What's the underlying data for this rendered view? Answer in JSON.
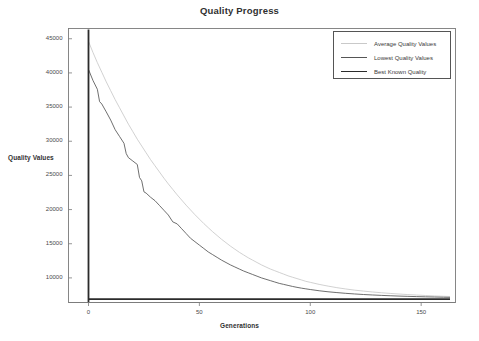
{
  "chart_data": {
    "type": "line",
    "title": "Quality Progress",
    "xlabel": "Generations",
    "ylabel": "Quality Values",
    "grid": false,
    "legend_position": "top-right",
    "xlim": [
      -5,
      165
    ],
    "ylim": [
      6400,
      46500
    ],
    "xticks": [
      0,
      50,
      100,
      150
    ],
    "xtick_labels": [
      "0",
      "50",
      "100",
      "150"
    ],
    "yticks": [
      10000,
      15000,
      20000,
      25000,
      30000,
      35000,
      40000,
      45000
    ],
    "ytick_labels": [
      "10000",
      "15000",
      "20000",
      "25000",
      "30000",
      "35000",
      "40000",
      "45000"
    ],
    "series": [
      {
        "name": "Average Quality Values",
        "color": "#c9c9c9",
        "x": [
          0,
          2,
          4,
          6,
          8,
          10,
          12,
          14,
          16,
          18,
          20,
          22,
          24,
          26,
          28,
          30,
          32,
          34,
          36,
          38,
          40,
          42,
          44,
          46,
          48,
          50,
          52,
          54,
          56,
          58,
          60,
          62,
          64,
          66,
          68,
          70,
          72,
          74,
          76,
          78,
          80,
          82,
          84,
          86,
          88,
          90,
          92,
          94,
          96,
          98,
          100,
          104,
          108,
          112,
          116,
          120,
          124,
          128,
          132,
          136,
          140,
          144,
          148,
          152,
          156,
          160,
          163
        ],
        "values": [
          44600,
          43000,
          41500,
          40100,
          38700,
          37400,
          36100,
          34900,
          33700,
          32500,
          31400,
          30300,
          29300,
          28300,
          27300,
          26400,
          25500,
          24600,
          23750,
          22950,
          22150,
          21400,
          20650,
          19950,
          19250,
          18600,
          17950,
          17350,
          16750,
          16200,
          15650,
          15150,
          14650,
          14200,
          13750,
          13350,
          12950,
          12600,
          12250,
          11900,
          11600,
          11300,
          11050,
          10800,
          10550,
          10300,
          10100,
          9900,
          9700,
          9500,
          9350,
          9050,
          8800,
          8570,
          8380,
          8210,
          8070,
          7940,
          7830,
          7730,
          7640,
          7560,
          7490,
          7420,
          7360,
          7310,
          7280
        ]
      },
      {
        "name": "Lowest Quality Values",
        "color": "#555555",
        "x": [
          0,
          2,
          4,
          5,
          6,
          8,
          10,
          12,
          14,
          16,
          17,
          18,
          20,
          22,
          23,
          24,
          25,
          26,
          28,
          30,
          32,
          34,
          36,
          38,
          40,
          42,
          44,
          46,
          48,
          50,
          52,
          54,
          56,
          58,
          60,
          62,
          64,
          66,
          68,
          70,
          72,
          74,
          76,
          78,
          80,
          82,
          84,
          86,
          88,
          90,
          92,
          94,
          96,
          98,
          100,
          104,
          108,
          112,
          116,
          120,
          124,
          128,
          132,
          136,
          140,
          144,
          148,
          152,
          156,
          160,
          163
        ],
        "values": [
          40500,
          38900,
          37600,
          35800,
          35450,
          34300,
          33100,
          31700,
          30700,
          29700,
          28200,
          27600,
          27100,
          26600,
          24700,
          24200,
          22600,
          22400,
          21800,
          21300,
          20600,
          19900,
          19200,
          18200,
          17900,
          17200,
          16500,
          15800,
          15300,
          14800,
          14300,
          13800,
          13400,
          13000,
          12600,
          12250,
          11900,
          11600,
          11300,
          11000,
          10750,
          10500,
          10250,
          10000,
          9800,
          9600,
          9400,
          9200,
          9050,
          8900,
          8750,
          8620,
          8500,
          8400,
          8300,
          8120,
          7970,
          7850,
          7740,
          7650,
          7570,
          7500,
          7440,
          7390,
          7340,
          7300,
          7260,
          7230,
          7200,
          7170,
          7150
        ]
      },
      {
        "name": "Best Known Quality",
        "color": "#2b2b2b",
        "x": [
          0,
          163
        ],
        "values": [
          6900,
          6900
        ]
      }
    ]
  },
  "legend": {
    "items": [
      {
        "label": "Average Quality Values",
        "color": "#c9c9c9"
      },
      {
        "label": "Lowest Quality Values",
        "color": "#555555"
      },
      {
        "label": "Best Known Quality",
        "color": "#2b2b2b"
      }
    ]
  },
  "colors": {
    "frame": "#7a7a7a",
    "axis": "#2b2b2b",
    "text": "#3a3a3a",
    "background": "#ffffff"
  }
}
